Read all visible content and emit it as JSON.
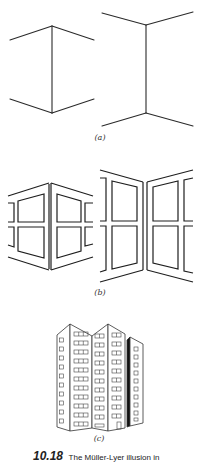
{
  "figure": {
    "panels": [
      {
        "id": "a",
        "label": "(a)",
        "description": "Müller-Lyer figures drawn as corner lines: arrowheads inward (left) and outward (right)"
      },
      {
        "id": "b",
        "label": "(b)",
        "description": "Outside and inside corners with window frames"
      },
      {
        "id": "c",
        "label": "(c)",
        "description": "Building with outside and inside corners"
      }
    ],
    "caption": {
      "number": "10.18",
      "text": "The Müller-Lyer illusion in"
    },
    "colors": {
      "line": "#222222",
      "background": "#ffffff"
    }
  }
}
